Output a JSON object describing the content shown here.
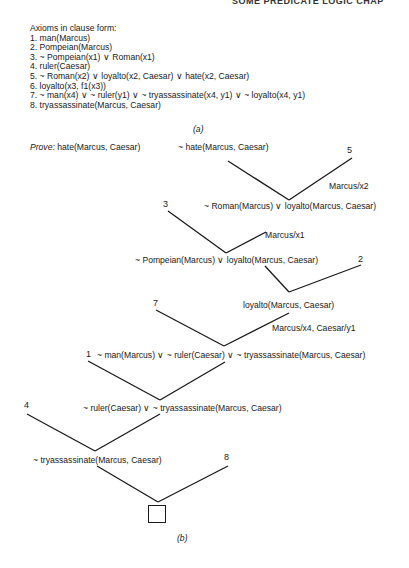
{
  "header": {
    "running_head": "SOME PREDICATE LOGIC    CHAP"
  },
  "part_a": {
    "title": "Axioms in clause form:",
    "axioms": [
      "1.  man(Marcus)",
      "2.  Pompeian(Marcus)",
      "3.  ~ Pompeian(x1) ∨  Roman(x1)",
      "4.  ruler(Caesar)",
      "5.  ~ Roman(x2) ∨ loyalto(x2, Caesar) ∨ hate(x2, Caesar)",
      "6.  loyalto(x3, f1(x3))",
      "7.  ~ man(x4) ∨ ~ ruler(y1) ∨  ~ tryassassinate(x4, y1) ∨  ~ loyalto(x4, y1)",
      "8.  tryassassinate(Marcus, Caesar)"
    ],
    "caption": "(a)"
  },
  "part_b": {
    "prove_keyword": "Prove:",
    "prove_goal": "hate(Marcus, Caesar)",
    "nodes": {
      "negated_goal": "~ hate(Marcus, Caesar)",
      "step1": "~ Roman(Marcus) ∨  loyalto(Marcus, Caesar)",
      "step2": "~ Pompeian(Marcus) ∨  loyalto(Marcus, Caesar)",
      "step3": "loyalto(Marcus, Caesar)",
      "step4": "~ man(Marcus) ∨ ~ ruler(Caesar) ∨  ~ tryassassinate(Marcus, Caesar)",
      "step5": "~ ruler(Caesar)  ∨  ~ tryassassinate(Marcus, Caesar)",
      "step6": "~ tryassassinate(Marcus, Caesar)"
    },
    "axiom_refs": {
      "r5": "5",
      "r3": "3",
      "r2": "2",
      "r7": "7",
      "r1": "1",
      "r4": "4",
      "r8": "8"
    },
    "substitutions": {
      "s1": "Marcus/x2",
      "s2": "Marcus/x1",
      "s3": "Marcus/x4, Caesar/y1"
    },
    "empty_clause": "□",
    "caption": "(b)"
  }
}
